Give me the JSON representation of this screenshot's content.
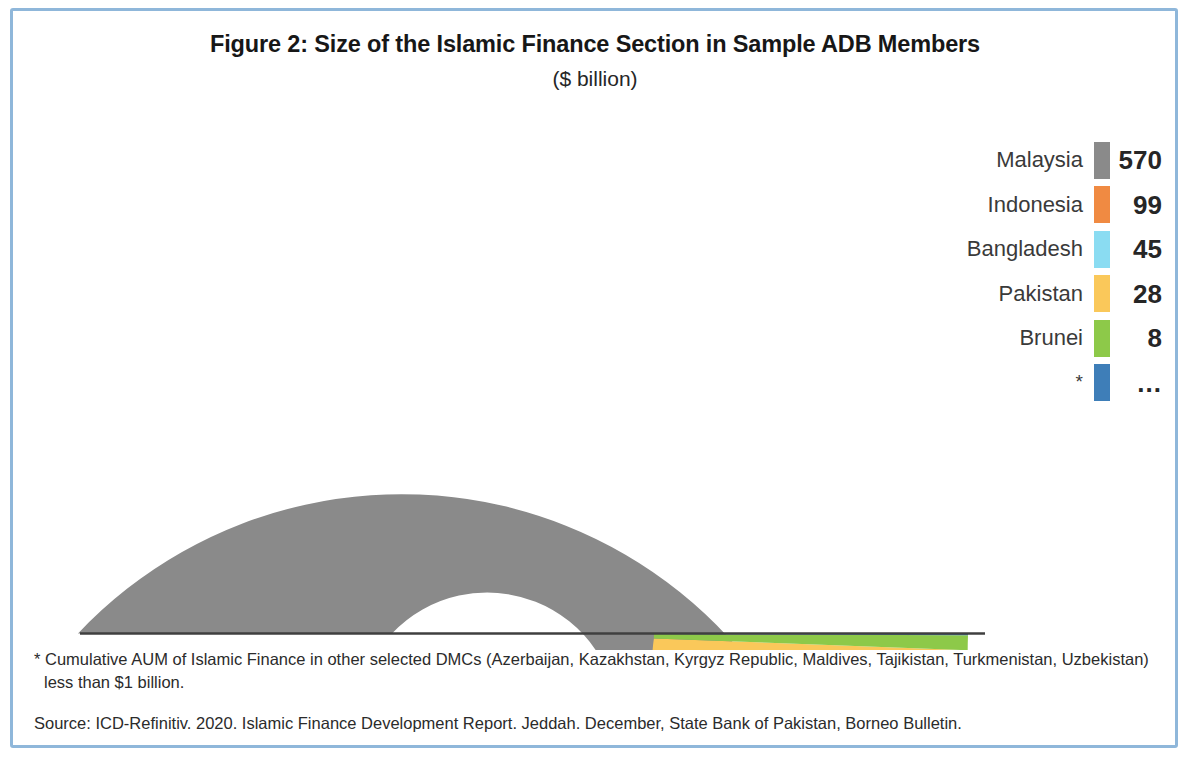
{
  "figure": {
    "title": "Figure 2: Size of the Islamic Finance Section in Sample ADB Members",
    "subtitle": "($ billion)"
  },
  "legend": {
    "rows": [
      {
        "label": "Malaysia",
        "value": "570",
        "color": "#8a8a8a"
      },
      {
        "label": "Indonesia",
        "value": "99",
        "color": "#f08a42"
      },
      {
        "label": "Bangladesh",
        "value": "45",
        "color": "#8adcf2"
      },
      {
        "label": "Pakistan",
        "value": "28",
        "color": "#fac85a"
      },
      {
        "label": "Brunei",
        "value": "8",
        "color": "#8dc949"
      },
      {
        "label": "*",
        "value": "...",
        "color": "#3e7eb8"
      }
    ]
  },
  "notes": {
    "footnote": "* Cumulative AUM of Islamic Finance in other selected DMCs (Azerbaijan, Kazakhstan, Kyrgyz Republic, Maldives, Tajikistan, Turkmenistan, Uzbekistan) less than $1 billion.",
    "source": "Source: ICD-Refinitiv. 2020. Islamic Finance Development Report. Jeddah. December, State Bank of Pakistan, Borneo Bulletin."
  },
  "chart_data": {
    "type": "pie",
    "variant": "half-donut",
    "title": "Figure 2: Size of the Islamic Finance Section in Sample ADB Members",
    "subtitle": "($ billion)",
    "unit": "$ billion",
    "start_angle_deg": 180,
    "sweep_deg": 180,
    "direction": "clockwise",
    "inner_radius_px": 131,
    "outer_radius_px": 445,
    "center_px": [
      523,
      633
    ],
    "labels": [
      "Malaysia",
      "Indonesia",
      "Bangladesh",
      "Pakistan",
      "Brunei",
      "*"
    ],
    "values": [
      570,
      99,
      45,
      28,
      8,
      1
    ],
    "colors": [
      "#8a8a8a",
      "#f08a42",
      "#8adcf2",
      "#fac85a",
      "#8dc949",
      "#3e7eb8"
    ],
    "value_labels": [
      "570",
      "99",
      "45",
      "28",
      "8",
      "..."
    ],
    "total": 751,
    "legend_position": "right",
    "grid": false
  },
  "style": {
    "frame_color": "#8fb7da",
    "baseline_color": "#3f3f3f",
    "background": "#ffffff"
  }
}
